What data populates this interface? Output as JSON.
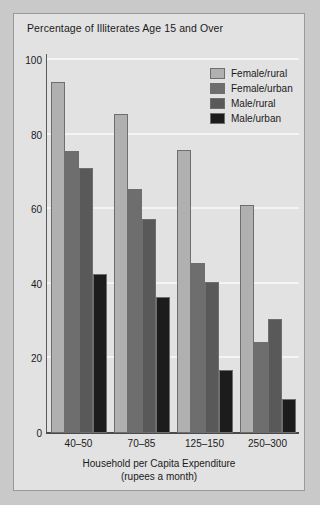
{
  "chart_data": {
    "type": "bar",
    "title": "Percentage of Illiterates Age 15 and Over",
    "xlabel": "Household per Capita Expenditure",
    "xlabel_sub": "(rupees a month)",
    "ylabel": "",
    "ylim": [
      0,
      100
    ],
    "yticks": [
      0,
      20,
      40,
      60,
      80,
      100
    ],
    "ytick_labels": [
      "0",
      "20",
      "40",
      "60",
      "80",
      "100"
    ],
    "grid": true,
    "legend_position": "top-right",
    "categories": [
      "40–50",
      "70–85",
      "125–150",
      "250–300"
    ],
    "series": [
      {
        "name": "Female/rural",
        "color": "#b0b0b0",
        "values": [
          94,
          85.5,
          76,
          61
        ]
      },
      {
        "name": "Female/urban",
        "color": "#6e6e6e",
        "values": [
          75.5,
          65.5,
          45.5,
          24.5
        ]
      },
      {
        "name": "Male/rural",
        "color": "#595959",
        "values": [
          71,
          57.5,
          40.5,
          30.5
        ]
      },
      {
        "name": "Male/urban",
        "color": "#1c1c1c",
        "values": [
          42.5,
          36.5,
          17,
          9
        ]
      }
    ]
  },
  "figure": {
    "background": "#e2e2e2",
    "page_background": "#c9c9c9",
    "border_color": "#9a9a9a",
    "gridline_color": "#f4f4f4",
    "axis_color": "#4a4a4a",
    "text_color": "#1a1a1a"
  }
}
